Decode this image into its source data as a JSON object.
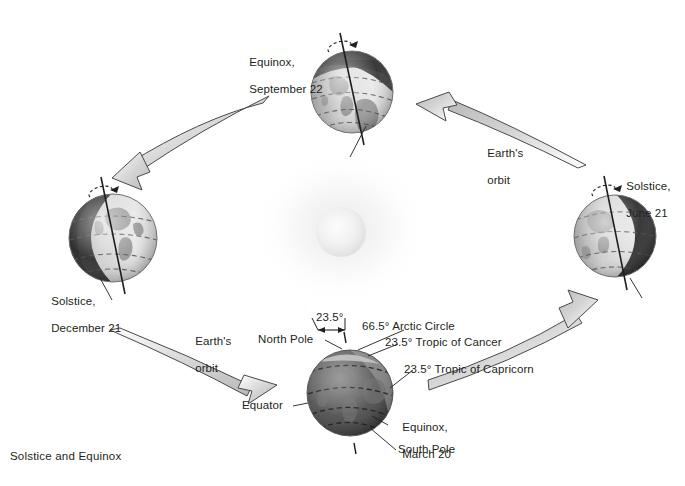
{
  "figure": {
    "caption": "Solstice and Equinox",
    "background_color": "#ffffff",
    "text_color": "#231f20",
    "arrow_fill": "#d8d8d8",
    "arrow_stroke": "#4a4a4a",
    "sun_color": "#f2f2f2"
  },
  "globes": [
    {
      "id": "september-equinox",
      "label_line1": "Equinox,",
      "label_line2": "September 22",
      "cx": 352,
      "cy": 92,
      "r": 41,
      "tilt_deg": -16,
      "shadow_side": "top"
    },
    {
      "id": "june-solstice",
      "label_line1": "Solstice,",
      "label_line2": "June 21",
      "cx": 615,
      "cy": 236,
      "r": 41,
      "tilt_deg": -16,
      "shadow_side": "right"
    },
    {
      "id": "december-solstice",
      "label_line1": "Solstice,",
      "label_line2": "December 21",
      "cx": 113,
      "cy": 238,
      "r": 44,
      "tilt_deg": -16,
      "shadow_side": "left"
    },
    {
      "id": "march-equinox",
      "label_line1": "Equinox,",
      "label_line2": "March 20",
      "cx": 350,
      "cy": 393,
      "r": 43,
      "tilt_deg": -16,
      "shadow_side": "none"
    }
  ],
  "orbit_labels": [
    {
      "id": "orbit-right",
      "line1": "Earth's",
      "line2": "orbit"
    },
    {
      "id": "orbit-left",
      "line1": "Earth's",
      "line2": "orbit"
    }
  ],
  "annotations": {
    "tilt_angle": "23.5°",
    "north_pole": "North Pole",
    "arctic_circle": "66.5° Arctic Circle",
    "tropic_cancer": "23.5° Tropic of Cancer",
    "tropic_capricorn": "23.5° Tropic of Capricorn",
    "equator": "Equator",
    "south_pole": "South Pole"
  },
  "arrows": [
    {
      "id": "arrow-top-left",
      "direction": "down-left",
      "description": "orbit arrow from September equinox toward December solstice"
    },
    {
      "id": "arrow-top-right",
      "direction": "up-left",
      "description": "orbit arrow from June solstice toward September equinox"
    },
    {
      "id": "arrow-bottom-left",
      "direction": "down-right",
      "description": "orbit arrow from December solstice toward March equinox"
    },
    {
      "id": "arrow-bottom-right",
      "direction": "up-right",
      "description": "orbit arrow from March equinox toward June solstice"
    }
  ]
}
